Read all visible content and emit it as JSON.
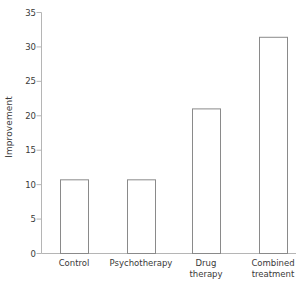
{
  "chart_data": {
    "type": "bar",
    "title": "",
    "xlabel": "",
    "ylabel": "Improvement",
    "categories": [
      "Control",
      "Psychotherapy",
      "Drug\ntherapy",
      "Combined\ntreatment"
    ],
    "values": [
      10.7,
      10.7,
      21.0,
      31.4
    ],
    "ylim": [
      0,
      35
    ],
    "yticks": [
      0,
      5,
      10,
      15,
      20,
      25,
      30,
      35
    ],
    "ytick_labels": [
      "0",
      "5",
      "10",
      "15",
      "20",
      "25",
      "30",
      "35"
    ],
    "grid": false,
    "legend": null,
    "bar_fill": "#ffffff",
    "bar_stroke": "#8a8a8a",
    "axis_color": "#b5b5b5",
    "text_color": "#3a3a3a"
  }
}
